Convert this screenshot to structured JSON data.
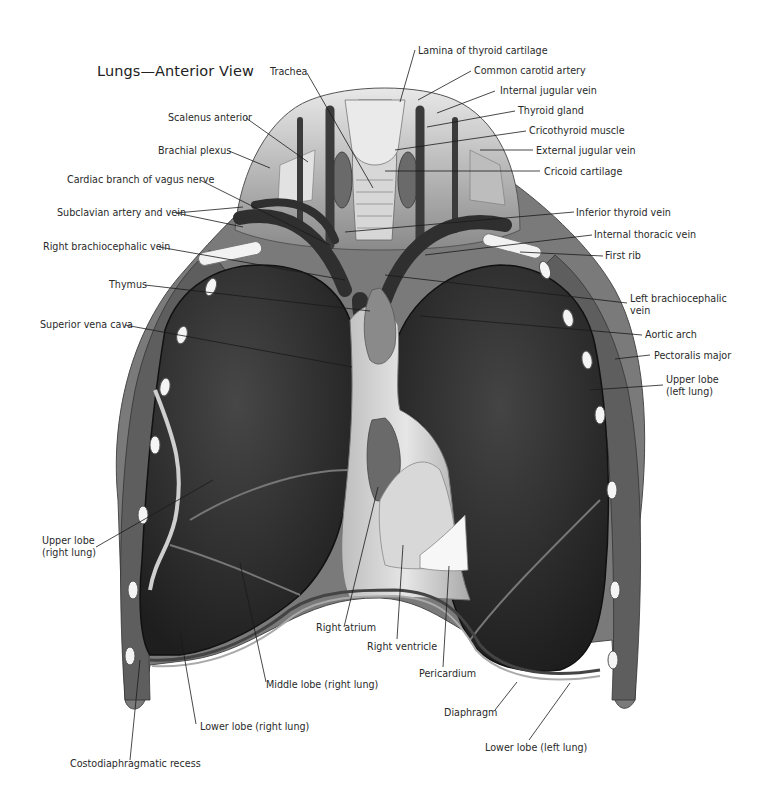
{
  "figure": {
    "title": "Lungs—Anterior View",
    "colors": {
      "background": "#ffffff",
      "lung": "#2f2f2f",
      "lung_dark": "#1c1c1c",
      "tissue_light": "#cfcfcf",
      "muscle": "#6e6e6e",
      "vessel": "#3a3a3a",
      "rib": "#f2f2f2",
      "leader_line": "#1a1a1a",
      "label_text": "#2a2a2a"
    }
  },
  "labels": {
    "trachea": "Trachea",
    "scalenus_anterior": "Scalenus anterior",
    "brachial_plexus": "Brachial plexus",
    "cardiac_branch_vagus": "Cardiac branch of vagus nerve",
    "subclavian": "Subclavian artery and vein",
    "right_brachiocephalic_vein": "Right brachiocephalic vein",
    "thymus": "Thymus",
    "superior_vena_cava": "Superior vena cava",
    "upper_lobe_right_l1": "Upper lobe",
    "upper_lobe_right_l2": "(right lung)",
    "middle_lobe_right": "Middle lobe (right lung)",
    "lower_lobe_right": "Lower lobe (right lung)",
    "costodiaphragmatic_recess": "Costodiaphragmatic recess",
    "right_atrium": "Right atrium",
    "right_ventricle": "Right ventricle",
    "pericardium": "Pericardium",
    "diaphragm": "Diaphragm",
    "lower_lobe_left": "Lower lobe (left lung)",
    "lamina_thyroid_cartilage": "Lamina of thyroid cartilage",
    "common_carotid_artery": "Common carotid artery",
    "internal_jugular_vein": "Internal jugular vein",
    "thyroid_gland": "Thyroid gland",
    "cricothyroid_muscle": "Cricothyroid muscle",
    "external_jugular_vein": "External jugular vein",
    "cricoid_cartilage": "Cricoid cartilage",
    "inferior_thyroid_vein": "Inferior thyroid vein",
    "internal_thoracic_vein": "Internal thoracic vein",
    "first_rib": "First rib",
    "left_brachiocephalic_l1": "Left brachiocephalic",
    "left_brachiocephalic_l2": "vein",
    "aortic_arch": "Aortic arch",
    "pectoralis_major": "Pectoralis major",
    "upper_lobe_left_l1": "Upper lobe",
    "upper_lobe_left_l2": "(left lung)"
  }
}
